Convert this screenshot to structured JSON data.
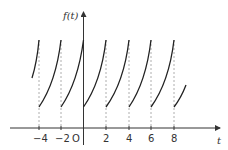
{
  "diagram": {
    "type": "periodic-function-graph",
    "y_axis_label": "f(t)",
    "x_axis_label": "t",
    "origin_label": "O",
    "x_tick_labels": [
      "−4",
      "−2",
      "2",
      "4",
      "6",
      "8"
    ],
    "x_tick_values": [
      -4,
      -2,
      2,
      4,
      6,
      8
    ],
    "period": 2,
    "colors": {
      "curve": "#222222",
      "axis": "#333333",
      "dashed": "#999999"
    }
  }
}
